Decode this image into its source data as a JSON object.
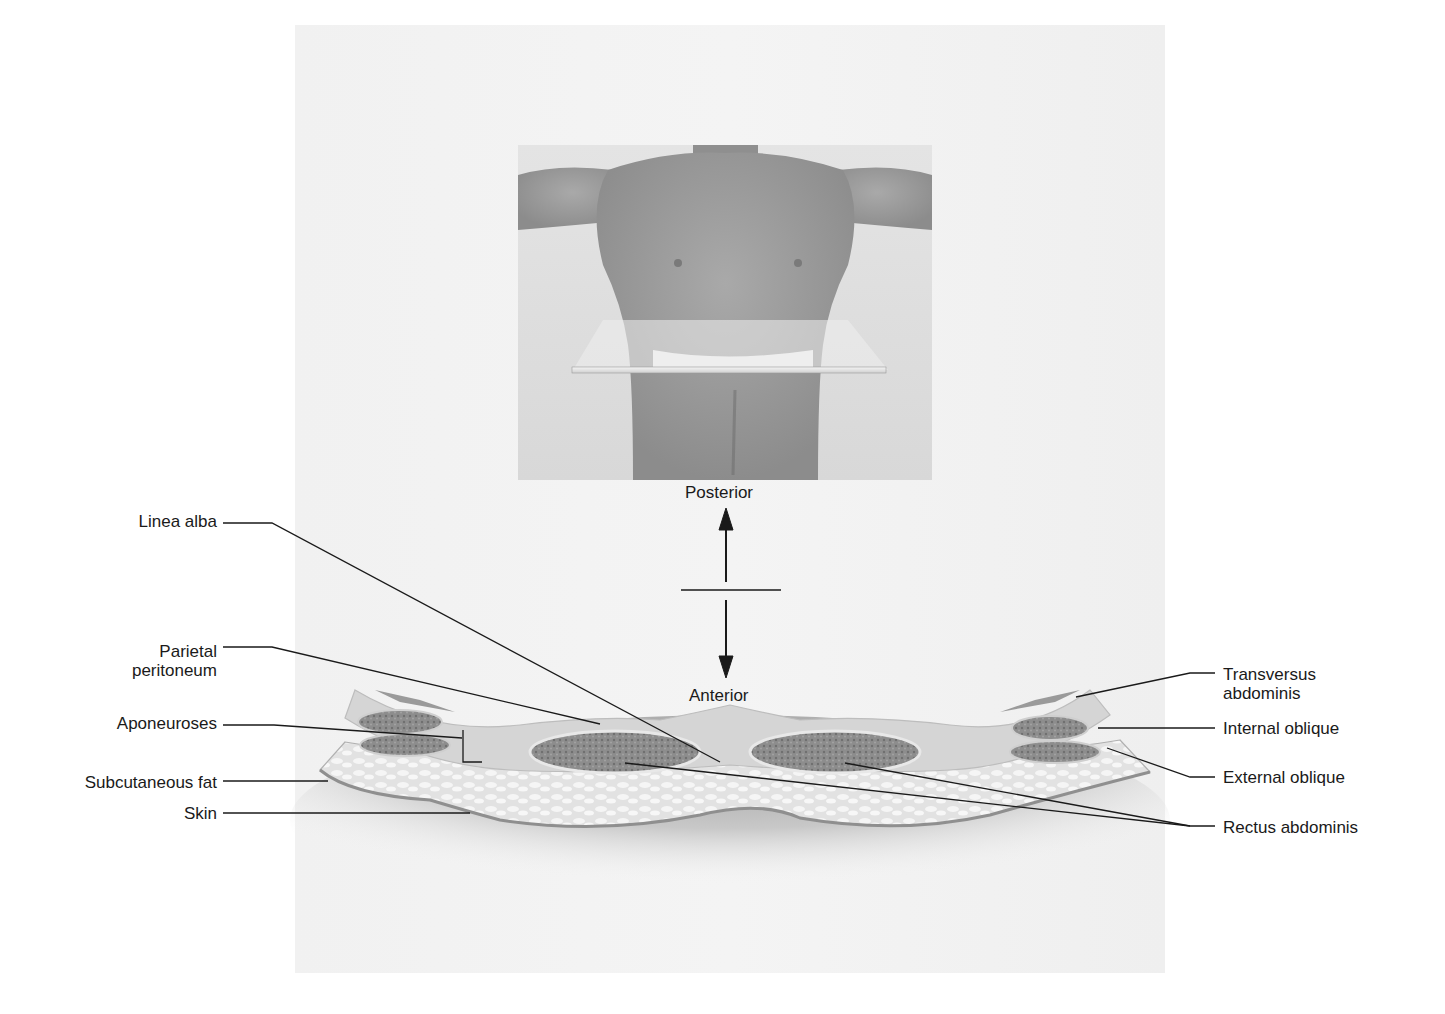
{
  "figure": {
    "orientation": {
      "top": "Posterior",
      "bottom": "Anterior"
    },
    "left_labels": [
      {
        "id": "linea-alba",
        "text": "Linea alba"
      },
      {
        "id": "parietal-peritoneum",
        "line1": "Parietal",
        "line2": "peritoneum"
      },
      {
        "id": "aponeuroses",
        "text": "Aponeuroses"
      },
      {
        "id": "subcutaneous-fat",
        "text": "Subcutaneous fat"
      },
      {
        "id": "skin",
        "text": "Skin"
      }
    ],
    "right_labels": [
      {
        "id": "transversus-abdominis",
        "line1": "Transversus",
        "line2": "abdominis"
      },
      {
        "id": "internal-oblique",
        "text": "Internal oblique"
      },
      {
        "id": "external-oblique",
        "text": "External oblique"
      },
      {
        "id": "rectus-abdominis",
        "text": "Rectus abdominis"
      }
    ],
    "colors": {
      "background_panel": "#f2f2f2",
      "muscle": "#8a8a8a",
      "fat": "#e6e6e6",
      "leader_line": "#1a1a1a"
    }
  }
}
